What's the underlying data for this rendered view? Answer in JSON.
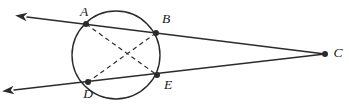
{
  "figure": {
    "type": "circle-secants-diagram",
    "canvas": {
      "width": 349,
      "height": 111
    },
    "stroke_color": "#2b2b2b",
    "label_color": "#1a1a1a",
    "background_color": "#ffffff",
    "circle": {
      "name": "circle",
      "center_x": 116,
      "center_y": 55,
      "radius": 44,
      "stroke_width": 1.4
    },
    "points": [
      {
        "id": "A",
        "label": "A",
        "x": 86,
        "y": 24,
        "label_x": 84,
        "label_y": 13,
        "on_circle": true,
        "dot": true
      },
      {
        "id": "B",
        "label": "B",
        "x": 156,
        "y": 33,
        "label_x": 166,
        "label_y": 20,
        "on_circle": true,
        "dot": true
      },
      {
        "id": "C",
        "label": "C",
        "x": 325,
        "y": 54,
        "label_x": 338,
        "label_y": 54,
        "on_circle": false,
        "dot": true
      },
      {
        "id": "D",
        "label": "D",
        "x": 88,
        "y": 82,
        "label_x": 88,
        "label_y": 95,
        "on_circle": true,
        "dot": true
      },
      {
        "id": "E",
        "label": "E",
        "x": 157,
        "y": 75,
        "label_x": 168,
        "label_y": 86,
        "on_circle": true,
        "dot": true
      }
    ],
    "solid_lines": [
      {
        "name": "secant-line-upper",
        "through": "arrow-A-B-C",
        "x1": 27,
        "y1": 17,
        "x2": 325,
        "y2": 54,
        "arrow_start": true,
        "arrow_end": false,
        "stroke_width": 1.4
      },
      {
        "name": "secant-line-lower",
        "through": "arrow-D-E-C",
        "x1": 14,
        "y1": 90,
        "x2": 325,
        "y2": 54,
        "arrow_start": true,
        "arrow_end": false,
        "stroke_width": 1.4
      }
    ],
    "dashed_chords": [
      {
        "name": "chord-A-E",
        "from": "A",
        "to": "E",
        "x1": 86,
        "y1": 24,
        "x2": 157,
        "y2": 75,
        "dash": "4.5,3.5",
        "stroke_width": 1.2
      },
      {
        "name": "chord-B-D",
        "from": "B",
        "to": "D",
        "x1": 156,
        "y1": 33,
        "x2": 88,
        "y2": 82,
        "dash": "4.5,3.5",
        "stroke_width": 1.2
      }
    ],
    "dot_radius": 3.0
  }
}
